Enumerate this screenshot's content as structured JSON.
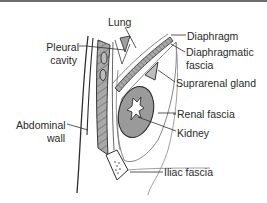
{
  "diagram": {
    "colors": {
      "line": "#3a3a3a",
      "muscle_fill": "#a9a9a9",
      "kidney_fill": "#9a9a9a",
      "background": "#ffffff",
      "top_rule": "#6e6e6e"
    },
    "labels": {
      "lung": "Lung",
      "pleural_cavity_1": "Pleural",
      "pleural_cavity_2": "cavity",
      "diaphragm": "Diaphragm",
      "diaphragmatic_fascia_1": "Diaphragmatic",
      "diaphragmatic_fascia_2": "fascia",
      "suprarenal_gland": "Suprarenal gland",
      "renal_fascia": "Renal fascia",
      "kidney": "Kidney",
      "abdominal_wall_1": "Abdominal",
      "abdominal_wall_2": "wall",
      "iliac_fascia": "Iliac fascia"
    }
  }
}
